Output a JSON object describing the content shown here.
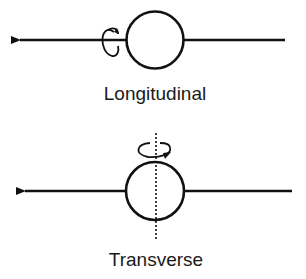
{
  "diagram": {
    "colors": {
      "stroke": "#111111",
      "text": "#1a1a1a",
      "background": "#ffffff"
    },
    "panels": [
      {
        "id": "longitudinal",
        "label": "Longitudinal",
        "rotation_axis": "horizontal (along the line)",
        "icons": [
          "arrow-left-icon",
          "rotation-arrow-icon",
          "circle"
        ]
      },
      {
        "id": "transverse",
        "label": "Transverse",
        "rotation_axis": "vertical (dotted line through circle)",
        "icons": [
          "arrow-left-icon",
          "rotation-arrow-icon",
          "circle",
          "dotted-axis"
        ]
      }
    ]
  }
}
